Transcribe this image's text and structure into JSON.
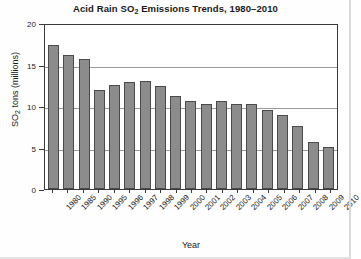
{
  "chart_data": {
    "type": "bar",
    "title": "Acid Rain SO2 Emissions Trends, 1980–2010",
    "title_prefix": "Acid Rain SO",
    "title_sub": "2",
    "title_suffix": " Emissions Trends, 1980–2010",
    "xlabel": "Year",
    "ylabel": "SO2 tons (millions)",
    "ylabel_prefix": "SO",
    "ylabel_sub": "2",
    "ylabel_suffix": " tons (millions)",
    "categories": [
      "1980",
      "1985",
      "1990",
      "1995",
      "1996",
      "1997",
      "1998",
      "1999",
      "2000",
      "2001",
      "2002",
      "2003",
      "2004",
      "2005",
      "2006",
      "2007",
      "2008",
      "2009",
      "2010"
    ],
    "values": [
      17.3,
      16.1,
      15.7,
      11.9,
      12.5,
      12.9,
      13.0,
      12.4,
      11.2,
      10.6,
      10.2,
      10.6,
      10.3,
      10.2,
      9.5,
      8.9,
      7.6,
      5.7,
      5.1
    ],
    "ylim": [
      0,
      20
    ],
    "yticks": [
      "20",
      "15",
      "10",
      "5",
      "0"
    ],
    "ytick_values": [
      20,
      15,
      10,
      5,
      0
    ],
    "grid": true,
    "grid_axis": "y",
    "legend": "none",
    "bar_color": "#8c8c8c",
    "bar_edge_color": "#4a4a4a",
    "grid_color": "#9a9a9a",
    "frame_color": "#3a3a3a",
    "background_color": "#ffffff"
  }
}
